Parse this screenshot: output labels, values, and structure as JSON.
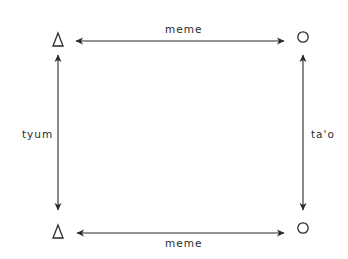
{
  "diagram": {
    "nodes": [
      {
        "id": "top-left",
        "shape": "triangle",
        "x": 58,
        "y": 40
      },
      {
        "id": "top-right",
        "shape": "circle",
        "x": 303,
        "y": 36
      },
      {
        "id": "bottom-left",
        "shape": "triangle",
        "x": 58,
        "y": 232
      },
      {
        "id": "bottom-right",
        "shape": "circle",
        "x": 303,
        "y": 228
      }
    ],
    "edges": [
      {
        "from": "top-left",
        "to": "top-right",
        "label": "meme",
        "bidirectional": true
      },
      {
        "from": "bottom-left",
        "to": "bottom-right",
        "label": "meme",
        "bidirectional": true
      },
      {
        "from": "top-left",
        "to": "bottom-left",
        "label": "tyum",
        "bidirectional": true
      },
      {
        "from": "top-right",
        "to": "bottom-right",
        "label": "ta'o",
        "bidirectional": true
      }
    ],
    "labels": {
      "top": "meme",
      "bottom": "meme",
      "left": "tyum",
      "right": "ta'o"
    },
    "colors": {
      "stroke": "#2a2a2a",
      "background": "#ffffff"
    }
  }
}
